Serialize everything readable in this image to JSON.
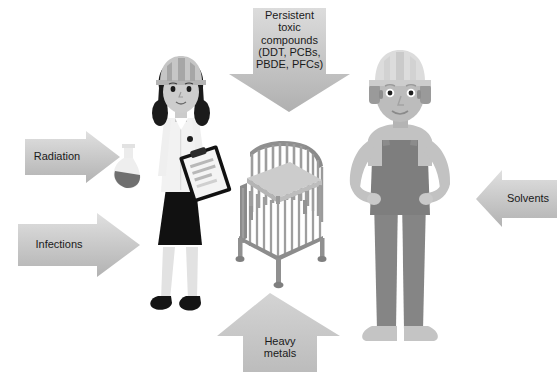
{
  "canvas": {
    "width": 560,
    "height": 374,
    "background": "#ffffff"
  },
  "diagram": {
    "center_object": "baby-crib"
  },
  "arrows": [
    {
      "id": "persistent-toxic-compounds",
      "label": "Persistent\ntoxic\ncompounds\n(DDT, PCBs,\nPBDE, PFCs)",
      "direction": "down",
      "position": "top-center",
      "fill_top": "#d5d5d5",
      "fill_bottom": "#b4b4b4",
      "font_size": 11
    },
    {
      "id": "radiation",
      "label": "Radiation",
      "direction": "right",
      "position": "left-upper",
      "fill_top": "#dadada",
      "fill_bottom": "#b6b6b6",
      "font_size": 11
    },
    {
      "id": "infections",
      "label": "Infections",
      "direction": "right",
      "position": "left-lower",
      "fill_top": "#dcdcdc",
      "fill_bottom": "#b8b8b8",
      "font_size": 11
    },
    {
      "id": "solvents",
      "label": "Solvents",
      "direction": "left",
      "position": "right-center",
      "fill_top": "#dadada",
      "fill_bottom": "#b6b6b6",
      "font_size": 11
    },
    {
      "id": "heavy-metals",
      "label": "Heavy\nmetals",
      "direction": "up",
      "position": "bottom-center",
      "fill_top": "#d2d2d2",
      "fill_bottom": "#bdbdbd",
      "font_size": 11
    }
  ],
  "figures": [
    {
      "id": "female-worker",
      "name": "female-lab-worker",
      "accessories": [
        "hard-hat",
        "clipboard",
        "lab-coat",
        "flask"
      ],
      "colors": {
        "hat": "#c9c9c9",
        "hat_shade": "#a8a8a8",
        "hair": "#1c1c1c",
        "skin": "#cfcfcf",
        "coat": "#efefef",
        "skirt": "#111111",
        "shoes": "#121212",
        "legs": "#dcdcdc"
      }
    },
    {
      "id": "male-worker",
      "name": "male-construction-worker",
      "accessories": [
        "hard-hat",
        "ear-defenders",
        "overalls"
      ],
      "colors": {
        "hat": "#d8d8d8",
        "hat_shade": "#c2c2c2",
        "skin": "#b9b9b9",
        "shirt": "#c2c2c2",
        "overalls": "#8a8a8a",
        "overalls_dark": "#7d7d7d",
        "shoes": "#c6c6c6"
      }
    }
  ],
  "crib": {
    "id": "baby-crib",
    "name": "crib",
    "colors": {
      "frame": "#9a9a9a",
      "frame_light": "#b3b3b3",
      "frame_dark": "#7e7e7e",
      "mattress": "#c8c8c8",
      "mattress_edge": "#aeaeae"
    }
  }
}
